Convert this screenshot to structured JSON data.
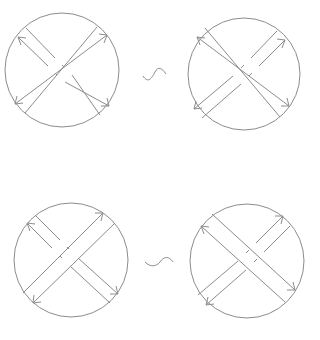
{
  "figure": {
    "stroke_color": "#8c8c8c",
    "background": "#ffffff",
    "relations": [
      {
        "symbol": "~",
        "left": {
          "circle": {
            "cx": 62,
            "cy": 70,
            "r": 57
          },
          "over_band": "ne-sw",
          "under_band": "nw-se",
          "arrows": [
            "upper-left",
            "upper-right",
            "lower-left",
            "lower-right"
          ]
        },
        "right": {
          "circle": {
            "cx": 244,
            "cy": 74,
            "r": 56
          },
          "over_band": "nw-se",
          "under_band": "ne-sw",
          "arrows": [
            "upper-left",
            "upper-right",
            "lower-left",
            "lower-right"
          ]
        }
      },
      {
        "symbol": "~",
        "left": {
          "circle": {
            "cx": 71,
            "cy": 260,
            "r": 57
          },
          "over_band": "ne-sw",
          "under_band": "nw-se",
          "arrows": [
            "upper-left",
            "upper-right",
            "lower-left",
            "lower-right"
          ]
        },
        "right": {
          "circle": {
            "cx": 247,
            "cy": 261,
            "r": 57
          },
          "over_band": "nw-se",
          "under_band": "ne-sw",
          "arrows": [
            "upper-left",
            "upper-right",
            "lower-left",
            "lower-right"
          ]
        }
      }
    ]
  }
}
